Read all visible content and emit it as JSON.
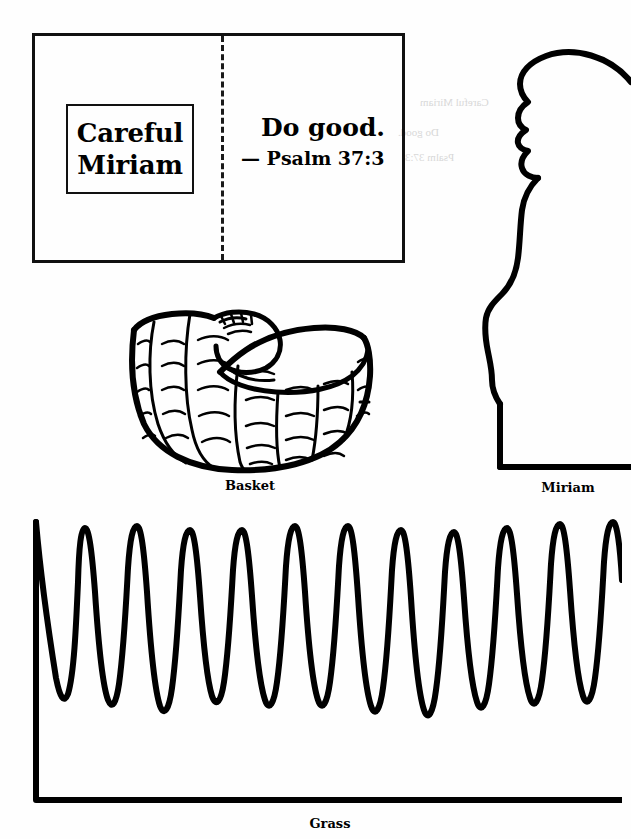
{
  "page": {
    "type": "printable-bible-craft-worksheet",
    "width": 631,
    "height": 839,
    "background_color": "#ffffff",
    "ink_color": "#000000"
  },
  "card": {
    "name": "greeting-card-template",
    "fold": "vertical-dashed-center-fold",
    "left_panel": {
      "boxed_title_line1": "Careful",
      "boxed_title_line2": "Miriam"
    },
    "right_panel": {
      "verse_text": "Do good.",
      "verse_reference": "— Psalm 37:3"
    }
  },
  "figures": [
    {
      "name": "basket",
      "label": "Basket",
      "description": "woven basket with baby inside"
    },
    {
      "name": "miriam",
      "label": "Miriam",
      "description": "profile silhouette outline of a girl"
    },
    {
      "name": "grass",
      "label": "Grass",
      "description": "zigzag grass blade strip"
    }
  ],
  "labels": {
    "basket": "Basket",
    "miriam": "Miriam",
    "grass": "Grass"
  },
  "bleed_through": {
    "line1": "Careful Miriam",
    "line2": "Do good.",
    "line3": "Psalm 37:3"
  }
}
